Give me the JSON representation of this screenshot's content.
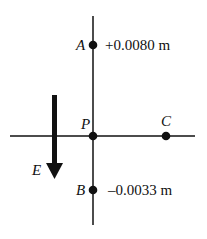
{
  "diagram": {
    "type": "electric field coordinate diagram",
    "field": {
      "label": "E",
      "direction": "down"
    },
    "points": [
      {
        "label": "A",
        "value": "+0.0080 m"
      },
      {
        "label": "P",
        "value": ""
      },
      {
        "label": "C",
        "value": ""
      },
      {
        "label": "B",
        "value": "–0.0033 m"
      }
    ]
  },
  "colors": {
    "ink": "#111111",
    "background": "#ffffff"
  }
}
